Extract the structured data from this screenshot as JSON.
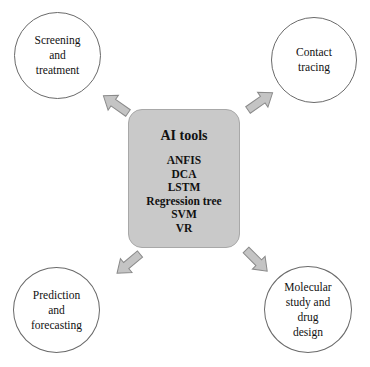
{
  "center": {
    "title": "AI tools",
    "items": [
      "ANFIS",
      "DCA",
      "LSTM",
      "Regression tree",
      "SVM",
      "VR"
    ]
  },
  "nodes": {
    "top_left": "Screening\nand\ntreatment",
    "top_right": "Contact\ntracing",
    "bottom_left": "Prediction\nand\nforecasting",
    "bottom_right": "Molecular\nstudy and\ndrug\ndesign"
  },
  "colors": {
    "box_fill": "#c9c9c9",
    "arrow_fill": "#c4c4c4",
    "arrow_stroke": "#8a8a8a",
    "circle_stroke": "#6a6a6a"
  }
}
